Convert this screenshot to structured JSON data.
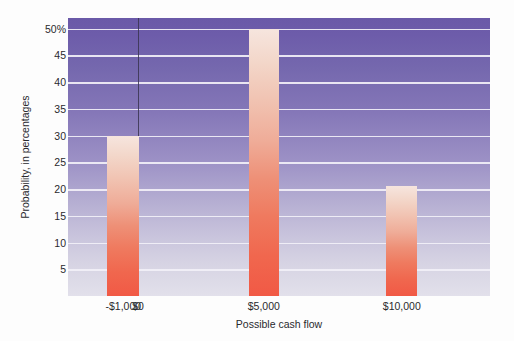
{
  "chart_data": {
    "type": "bar",
    "title": "",
    "xlabel": "Possible cash flow",
    "ylabel": "Probability, in percentages",
    "categories": [
      "-$1,000",
      "$0",
      "$5,000",
      "$10,000"
    ],
    "values": [
      30,
      0,
      50,
      20.5
    ],
    "ylim": [
      0,
      52
    ],
    "ytick_values": [
      5,
      10,
      15,
      20,
      25,
      30,
      35,
      40,
      45,
      50
    ],
    "ytick_labels": [
      "5",
      "10",
      "15",
      "20",
      "25",
      "30",
      "35",
      "40",
      "45",
      "50%"
    ],
    "grid": true,
    "legend": "none",
    "bars": [
      {
        "category": "-$1,000",
        "value": 30,
        "center_pct": 13.1,
        "width_pct": 7.6
      },
      {
        "category": "$5,000",
        "value": 50,
        "center_pct": 46.4,
        "width_pct": 7.1
      },
      {
        "category": "$10,000",
        "value": 20.5,
        "center_pct": 79.1,
        "width_pct": 7.3
      }
    ],
    "xtick_positions_pct": [
      13.1,
      16.6,
      46.4,
      79.1
    ],
    "zero_line_pct": 16.6,
    "colors": {
      "bar_top": "#f6e5de",
      "bar_bottom": "#f15945",
      "plot_top": "#6a59a8",
      "plot_bottom": "#e2e0eb",
      "gridline": "#f2f0f7",
      "zero_line": "#3a3550",
      "text": "#2a2a2e",
      "page_background": "#fdfdfd"
    }
  },
  "axes": {
    "y_title": "Probability, in percentages",
    "x_title": "Possible cash flow"
  }
}
